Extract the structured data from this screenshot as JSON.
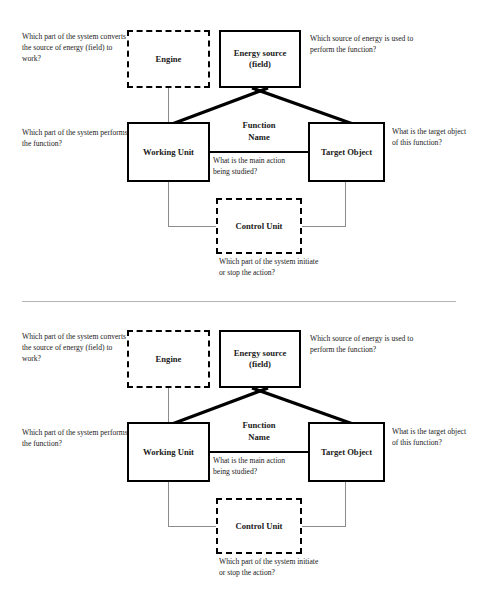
{
  "document": {
    "faint_header": "",
    "panel_count": 2
  },
  "diagram": {
    "type": "function-analysis-block-diagram",
    "boxes": {
      "engine": {
        "label": "Engine",
        "border": "dashed",
        "color": "#000000"
      },
      "energy_source": {
        "label": "Energy source\n(field)",
        "line1": "Energy source",
        "line2": "(field)",
        "border": "solid",
        "color": "#000000"
      },
      "working_unit": {
        "label": "Working Unit",
        "border": "solid",
        "color": "#000000"
      },
      "target_object": {
        "label": "Target Object",
        "border": "solid",
        "color": "#000000"
      },
      "control_unit": {
        "label": "Control Unit",
        "border": "dashed",
        "color": "#000000"
      }
    },
    "center_label": {
      "line1": "Function",
      "line2": "Name"
    },
    "annotations": {
      "engine_question": "Which part of the system converts the source of energy (field) to work?",
      "energy_question": "Which source of energy is used to perform the function?",
      "working_question": "Which part of the system performs the function?",
      "target_question": "What is the target object of this function?",
      "action_question": "What is the main action being studied?",
      "control_question": "Which part of the system initiate or stop the action?"
    },
    "connectors": [
      {
        "from": "engine",
        "to": "working_unit",
        "style": "thin-gray-vertical"
      },
      {
        "from": "energy_source",
        "to": "working_unit",
        "style": "thick-black-diagonal"
      },
      {
        "from": "energy_source",
        "to": "target_object",
        "style": "thick-black-diagonal"
      },
      {
        "from": "working_unit",
        "to": "target_object",
        "style": "thick-black-horizontal"
      },
      {
        "from": "working_unit",
        "to": "control_unit",
        "style": "thin-gray-elbow"
      },
      {
        "from": "target_object",
        "to": "control_unit",
        "style": "thin-gray-elbow"
      }
    ]
  },
  "colors": {
    "stroke_strong": "#000000",
    "stroke_light": "#8c8c8c",
    "divider": "#b4b4b4",
    "background": "#ffffff",
    "text": "#1a1a1a"
  }
}
